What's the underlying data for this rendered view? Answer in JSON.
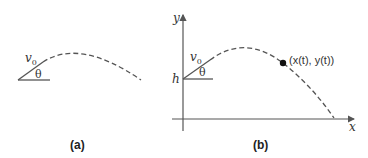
{
  "panels": [
    {
      "id": "a",
      "caption": "(a)",
      "labels": {
        "velocity": "v",
        "velocity_sub": "0",
        "angle": "θ"
      }
    },
    {
      "id": "b",
      "caption": "(b)",
      "labels": {
        "velocity": "v",
        "velocity_sub": "0",
        "angle": "θ",
        "height": "h",
        "y_axis": "y",
        "x_axis": "x",
        "point": "(x(t), y(t))"
      }
    }
  ],
  "colors": {
    "stroke": "#555555",
    "text": "#333333",
    "point": "#111111"
  }
}
